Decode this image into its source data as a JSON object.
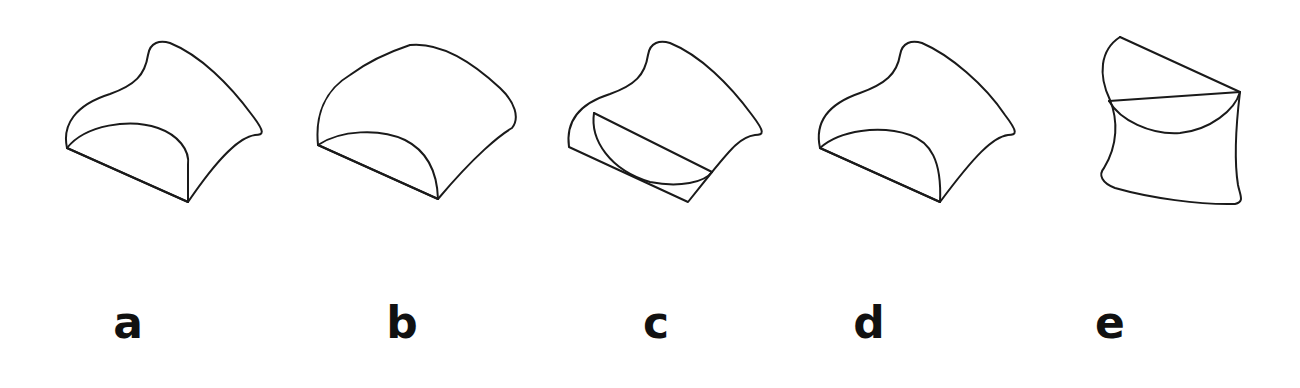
{
  "figure": {
    "stroke_color": "#1a1a1a",
    "background": "#ffffff",
    "options": [
      {
        "label": "a",
        "shape": "curved-surface with inner arc face"
      },
      {
        "label": "b",
        "shape": "rounded dome surface with inner arc face"
      },
      {
        "label": "c",
        "shape": "curved-surface with half-disc cut"
      },
      {
        "label": "d",
        "shape": "curved-surface with inner arc face"
      },
      {
        "label": "e",
        "shape": "rotated shape with chord and arc"
      }
    ]
  }
}
